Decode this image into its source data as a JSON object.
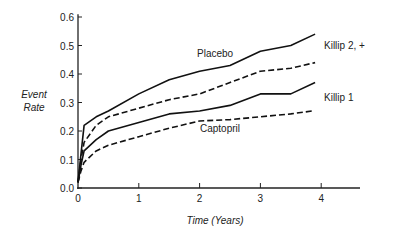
{
  "chart_data": {
    "type": "line",
    "title": "",
    "xlabel": "Time (Years)",
    "ylabel": "Event Rate",
    "xlim": [
      0,
      4.4
    ],
    "ylim": [
      0,
      0.6
    ],
    "x_ticks": [
      "0",
      "1",
      "2",
      "3",
      "4"
    ],
    "y_ticks": [
      "0.0",
      "0.1",
      "0.2",
      "0.3",
      "0.4",
      "0.5",
      "0.6"
    ],
    "grid": false,
    "legend": "inline labels",
    "group_labels": [
      "Killip 2, +",
      "Killip 1"
    ],
    "curve_labels": [
      "Placebo",
      "Captopril"
    ],
    "series": [
      {
        "name": "Killip 2,+ Placebo",
        "style": "solid",
        "x": [
          0,
          0.05,
          0.1,
          0.3,
          0.5,
          1.0,
          1.5,
          2.0,
          2.5,
          3.0,
          3.5,
          3.9
        ],
        "values": [
          0.02,
          0.12,
          0.22,
          0.25,
          0.27,
          0.33,
          0.38,
          0.41,
          0.43,
          0.48,
          0.5,
          0.54
        ]
      },
      {
        "name": "Killip 2,+ Captopril",
        "style": "dashed",
        "x": [
          0,
          0.05,
          0.1,
          0.3,
          0.5,
          1.0,
          1.5,
          2.0,
          2.5,
          3.0,
          3.5,
          3.9
        ],
        "values": [
          0.02,
          0.1,
          0.16,
          0.22,
          0.25,
          0.28,
          0.31,
          0.33,
          0.37,
          0.41,
          0.42,
          0.44
        ]
      },
      {
        "name": "Killip 1 Placebo",
        "style": "solid",
        "x": [
          0,
          0.05,
          0.1,
          0.3,
          0.5,
          1.0,
          1.5,
          2.0,
          2.5,
          3.0,
          3.5,
          3.9
        ],
        "values": [
          0.02,
          0.08,
          0.13,
          0.17,
          0.2,
          0.23,
          0.26,
          0.27,
          0.29,
          0.33,
          0.33,
          0.37
        ]
      },
      {
        "name": "Killip 1 Captopril",
        "style": "dashed",
        "x": [
          0,
          0.05,
          0.1,
          0.3,
          0.5,
          1.0,
          1.5,
          2.0,
          2.5,
          3.0,
          3.5,
          3.85
        ],
        "values": [
          0.02,
          0.06,
          0.09,
          0.13,
          0.15,
          0.18,
          0.21,
          0.235,
          0.24,
          0.25,
          0.26,
          0.27
        ]
      }
    ]
  }
}
